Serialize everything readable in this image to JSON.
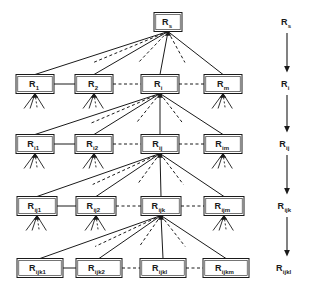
{
  "figure": {
    "kind": "hierarchical-tree-diagram",
    "levels": 5,
    "ink_color": "#1a1a1a",
    "background_color": "#ffffff"
  },
  "rows": [
    {
      "level": 1,
      "expanded_index": 0,
      "nodes": [
        {
          "base": "R",
          "sub": "s",
          "expanded": true
        }
      ]
    },
    {
      "level": 2,
      "expanded_index": 2,
      "nodes": [
        {
          "base": "R",
          "sub": "1",
          "expanded": false
        },
        {
          "base": "R",
          "sub": "2",
          "expanded": false
        },
        {
          "base": "R",
          "sub": "i",
          "expanded": true
        },
        {
          "base": "R",
          "sub": "m",
          "expanded": false
        }
      ]
    },
    {
      "level": 3,
      "expanded_index": 2,
      "nodes": [
        {
          "base": "R",
          "sub": "i1",
          "expanded": false
        },
        {
          "base": "R",
          "sub": "i2",
          "expanded": false
        },
        {
          "base": "R",
          "sub": "ij",
          "expanded": true
        },
        {
          "base": "R",
          "sub": "im",
          "expanded": false
        }
      ]
    },
    {
      "level": 4,
      "expanded_index": 2,
      "nodes": [
        {
          "base": "R",
          "sub": "ij1",
          "expanded": false
        },
        {
          "base": "R",
          "sub": "ij2",
          "expanded": false
        },
        {
          "base": "R",
          "sub": "ijk",
          "expanded": true
        },
        {
          "base": "R",
          "sub": "ijm",
          "expanded": false
        }
      ]
    },
    {
      "level": 5,
      "expanded_index": -1,
      "nodes": [
        {
          "base": "R",
          "sub": "ijk1",
          "expanded": false
        },
        {
          "base": "R",
          "sub": "ijk2",
          "expanded": false
        },
        {
          "base": "R",
          "sub": "ijkl",
          "expanded": false
        },
        {
          "base": "R",
          "sub": "ijkm",
          "expanded": false
        }
      ]
    }
  ],
  "sibling_connectors": [
    {
      "row": 2,
      "segments": [
        "solid",
        "dashed",
        "dashed"
      ]
    },
    {
      "row": 3,
      "segments": [
        "solid",
        "dashed",
        "dashed"
      ]
    },
    {
      "row": 4,
      "segments": [
        "solid",
        "dashed",
        "dashed"
      ]
    },
    {
      "row": 5,
      "segments": [
        "solid",
        "dashed",
        "dashed"
      ]
    }
  ],
  "axis": {
    "orientation": "vertical-downward",
    "steps": [
      {
        "base": "R",
        "sub": "s"
      },
      {
        "base": "R",
        "sub": "i"
      },
      {
        "base": "R",
        "sub": "ij"
      },
      {
        "base": "R",
        "sub": "ijk"
      },
      {
        "base": "R",
        "sub": "ijkl"
      }
    ],
    "arrow_count": 4
  }
}
